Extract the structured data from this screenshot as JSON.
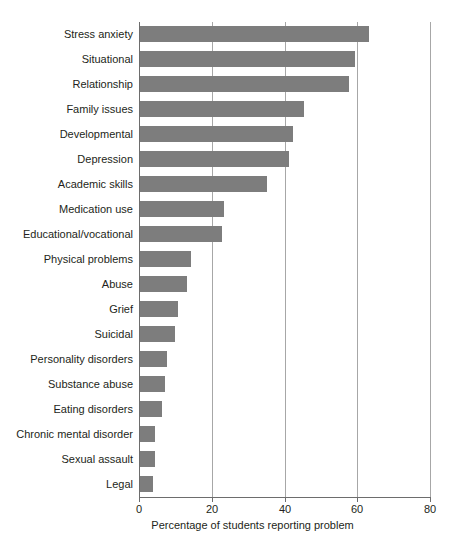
{
  "chart_data": {
    "type": "bar",
    "orientation": "horizontal",
    "title": "",
    "xlabel": "Percentage of students reporting problem",
    "ylabel": "",
    "xlim": [
      0,
      80
    ],
    "xticks": [
      0,
      20,
      40,
      60,
      80
    ],
    "xtick_labels": [
      "0",
      "20",
      "40",
      "60",
      "80"
    ],
    "grid": true,
    "grid_axis": "x",
    "legend": false,
    "bar_color": "#7d7d7d",
    "axis_color": "#6d6d6d",
    "gridline_color": "#a7a7a7",
    "categories": [
      "Stress anxiety",
      "Situational",
      "Relationship",
      "Family issues",
      "Developmental",
      "Depression",
      "Academic skills",
      "Medication use",
      "Educational/vocational",
      "Physical problems",
      "Abuse",
      "Grief",
      "Suicidal",
      "Personality disorders",
      "Substance abuse",
      "Eating disorders",
      "Chronic mental disorder",
      "Sexual assault",
      "Legal"
    ],
    "values": [
      63,
      59,
      57.5,
      45,
      42,
      41,
      35,
      23,
      22.5,
      14,
      13,
      10.5,
      9.5,
      7.5,
      7,
      6,
      4,
      4,
      3.5
    ]
  }
}
